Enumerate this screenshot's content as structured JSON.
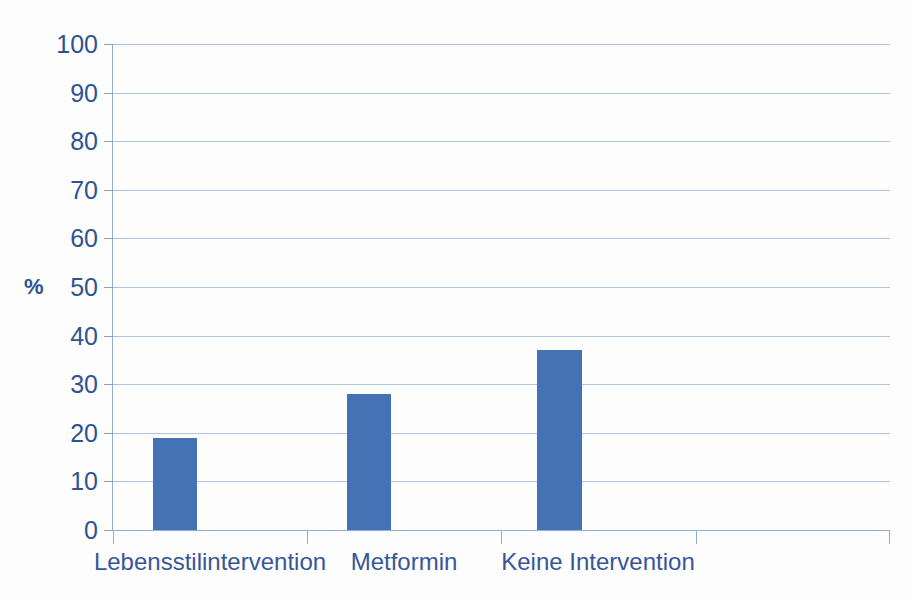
{
  "chart_data": {
    "type": "bar",
    "title": "",
    "subtitle": "",
    "xlabel": "",
    "ylabel": "%",
    "ylim": [
      0,
      100
    ],
    "ytick_step": 10,
    "yticks": [
      100,
      90,
      80,
      70,
      60,
      50,
      40,
      30,
      20,
      10,
      0
    ],
    "ytick_labels": [
      "100",
      "90",
      "80",
      "70",
      "60",
      "50",
      "40",
      "30",
      "20",
      "10",
      "0"
    ],
    "categories": [
      "Lebensstilintervention",
      "Metformin",
      "Keine Intervention",
      ""
    ],
    "values": [
      19,
      28,
      37,
      null
    ],
    "series": [
      {
        "name": "",
        "values": [
          19,
          28,
          37,
          null
        ]
      }
    ],
    "legend": [],
    "legend_position": "none",
    "grid": "horizontal",
    "annotations": [],
    "bar_color": "#4472b5",
    "gridline_color": "#aec5df",
    "axis_color": "#8fb0d4",
    "text_color": "#2f5391",
    "category_label_color": "#37569a",
    "background_color": "#fdfdfd"
  }
}
